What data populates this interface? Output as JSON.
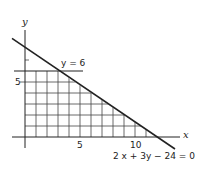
{
  "diagram": {
    "type": "linear-inequality-region",
    "axes": {
      "x_label": "x",
      "y_label": "y",
      "x_tick_labels": [
        "5",
        "10"
      ],
      "y_tick_labels": [
        "5"
      ]
    },
    "lines": [
      {
        "name": "horizontal-line",
        "equation": "y = 6",
        "label": "y = 6"
      },
      {
        "name": "slanted-line",
        "equation": "2x + 3y - 24 = 0",
        "label": "2 x + 3y − 24 = 0"
      }
    ],
    "shaded_region": {
      "style": "grid-hatch",
      "bounds": "0 ≤ x, 0 ≤ y ≤ 6, 2x + 3y ≤ 24"
    },
    "colors": {
      "line": "#222222",
      "grid": "#444444",
      "background": "#ffffff"
    }
  }
}
